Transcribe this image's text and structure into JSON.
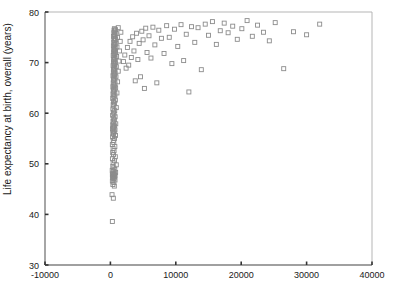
{
  "chart_data": {
    "type": "scatter",
    "title": "",
    "xlabel": "",
    "ylabel": "Life expectancy at birth, overall (years)",
    "xlim": [
      -10000,
      40000
    ],
    "ylim": [
      30,
      80
    ],
    "xticks": [
      -10000,
      0,
      10000,
      20000,
      30000,
      40000
    ],
    "xticklabels": [
      "-10000",
      "0",
      "10000",
      "20000",
      "30000",
      "40000"
    ],
    "yticks": [
      30,
      40,
      50,
      60,
      70,
      80
    ],
    "yticklabels": [
      "30",
      "40",
      "50",
      "60",
      "70",
      "80"
    ],
    "grid": false,
    "legend": null,
    "marker": "open-square",
    "marker_size_px": 4,
    "marker_color": "#8c8c8c",
    "axis_color": "#808080",
    "n_points": 198,
    "points": [
      [
        300,
        38.6
      ],
      [
        450,
        43.2
      ],
      [
        250,
        43.9
      ],
      [
        600,
        45.6
      ],
      [
        380,
        45.9
      ],
      [
        520,
        46.3
      ],
      [
        300,
        46.6
      ],
      [
        700,
        46.8
      ],
      [
        420,
        47.0
      ],
      [
        560,
        47.2
      ],
      [
        330,
        47.3
      ],
      [
        640,
        47.4
      ],
      [
        480,
        47.5
      ],
      [
        390,
        47.6
      ],
      [
        720,
        47.7
      ],
      [
        300,
        47.8
      ],
      [
        540,
        47.9
      ],
      [
        610,
        48.0
      ],
      [
        360,
        48.1
      ],
      [
        800,
        48.3
      ],
      [
        450,
        48.5
      ],
      [
        280,
        48.7
      ],
      [
        670,
        48.9
      ],
      [
        520,
        49.2
      ],
      [
        370,
        49.5
      ],
      [
        900,
        49.8
      ],
      [
        420,
        50.2
      ],
      [
        620,
        50.6
      ],
      [
        310,
        51.0
      ],
      [
        750,
        51.4
      ],
      [
        480,
        51.8
      ],
      [
        350,
        52.2
      ],
      [
        560,
        52.6
      ],
      [
        410,
        53.0
      ],
      [
        680,
        53.4
      ],
      [
        300,
        53.8
      ],
      [
        520,
        54.2
      ],
      [
        440,
        54.6
      ],
      [
        620,
        55.0
      ],
      [
        340,
        55.3
      ],
      [
        780,
        55.6
      ],
      [
        470,
        55.9
      ],
      [
        380,
        56.1
      ],
      [
        590,
        56.3
      ],
      [
        430,
        56.5
      ],
      [
        700,
        56.7
      ],
      [
        320,
        56.9
      ],
      [
        540,
        57.1
      ],
      [
        460,
        57.3
      ],
      [
        640,
        57.5
      ],
      [
        360,
        57.7
      ],
      [
        820,
        57.9
      ],
      [
        500,
        58.1
      ],
      [
        400,
        58.4
      ],
      [
        610,
        58.7
      ],
      [
        450,
        59.0
      ],
      [
        720,
        59.3
      ],
      [
        340,
        59.6
      ],
      [
        560,
        59.9
      ],
      [
        480,
        60.2
      ],
      [
        660,
        60.5
      ],
      [
        380,
        60.8
      ],
      [
        900,
        61.1
      ],
      [
        520,
        61.4
      ],
      [
        420,
        61.7
      ],
      [
        640,
        62.0
      ],
      [
        470,
        62.3
      ],
      [
        760,
        62.6
      ],
      [
        360,
        62.9
      ],
      [
        580,
        63.2
      ],
      [
        500,
        63.4
      ],
      [
        690,
        63.6
      ],
      [
        400,
        63.8
      ],
      [
        1000,
        64.0
      ],
      [
        540,
        64.2
      ],
      [
        440,
        64.4
      ],
      [
        660,
        64.6
      ],
      [
        490,
        64.8
      ],
      [
        800,
        65.0
      ],
      [
        380,
        65.2
      ],
      [
        600,
        65.4
      ],
      [
        520,
        65.6
      ],
      [
        710,
        65.8
      ],
      [
        430,
        66.0
      ],
      [
        1100,
        66.2
      ],
      [
        560,
        66.4
      ],
      [
        460,
        66.6
      ],
      [
        680,
        66.8
      ],
      [
        510,
        67.0
      ],
      [
        850,
        67.2
      ],
      [
        400,
        67.4
      ],
      [
        620,
        67.5
      ],
      [
        540,
        67.7
      ],
      [
        730,
        67.9
      ],
      [
        450,
        68.1
      ],
      [
        1200,
        68.3
      ],
      [
        580,
        68.5
      ],
      [
        480,
        68.6
      ],
      [
        700,
        68.8
      ],
      [
        530,
        69.0
      ],
      [
        900,
        69.2
      ],
      [
        420,
        69.4
      ],
      [
        640,
        69.5
      ],
      [
        560,
        69.7
      ],
      [
        760,
        69.9
      ],
      [
        470,
        70.1
      ],
      [
        1300,
        70.3
      ],
      [
        600,
        70.5
      ],
      [
        500,
        70.6
      ],
      [
        720,
        70.8
      ],
      [
        550,
        71.0
      ],
      [
        950,
        71.2
      ],
      [
        440,
        71.4
      ],
      [
        660,
        71.5
      ],
      [
        580,
        71.7
      ],
      [
        790,
        71.9
      ],
      [
        490,
        72.1
      ],
      [
        1400,
        72.3
      ],
      [
        620,
        72.4
      ],
      [
        520,
        72.6
      ],
      [
        740,
        72.8
      ],
      [
        570,
        73.0
      ],
      [
        1000,
        73.1
      ],
      [
        460,
        73.3
      ],
      [
        680,
        73.5
      ],
      [
        600,
        73.6
      ],
      [
        820,
        73.8
      ],
      [
        510,
        74.0
      ],
      [
        1500,
        74.2
      ],
      [
        650,
        74.3
      ],
      [
        540,
        74.5
      ],
      [
        770,
        74.7
      ],
      [
        590,
        74.8
      ],
      [
        1100,
        75.0
      ],
      [
        480,
        75.2
      ],
      [
        700,
        75.3
      ],
      [
        620,
        75.5
      ],
      [
        850,
        75.7
      ],
      [
        530,
        75.9
      ],
      [
        1600,
        76.0
      ],
      [
        670,
        76.2
      ],
      [
        560,
        76.4
      ],
      [
        790,
        76.5
      ],
      [
        610,
        76.7
      ],
      [
        1200,
        76.9
      ],
      [
        2000,
        70.2
      ],
      [
        2200,
        71.5
      ],
      [
        2400,
        68.9
      ],
      [
        2600,
        73.0
      ],
      [
        2800,
        69.5
      ],
      [
        3000,
        74.2
      ],
      [
        3200,
        71.0
      ],
      [
        3400,
        75.1
      ],
      [
        3600,
        72.3
      ],
      [
        3800,
        66.4
      ],
      [
        4000,
        75.8
      ],
      [
        4200,
        70.6
      ],
      [
        4400,
        73.8
      ],
      [
        4600,
        67.2
      ],
      [
        4800,
        76.2
      ],
      [
        5000,
        74.5
      ],
      [
        5200,
        64.9
      ],
      [
        5400,
        76.8
      ],
      [
        5600,
        72.0
      ],
      [
        5900,
        75.3
      ],
      [
        6200,
        70.9
      ],
      [
        6500,
        77.0
      ],
      [
        6800,
        73.5
      ],
      [
        7100,
        66.0
      ],
      [
        7400,
        76.4
      ],
      [
        7800,
        74.8
      ],
      [
        8200,
        71.8
      ],
      [
        8600,
        77.3
      ],
      [
        9000,
        75.0
      ],
      [
        9400,
        69.8
      ],
      [
        9800,
        76.6
      ],
      [
        10300,
        73.2
      ],
      [
        10800,
        77.5
      ],
      [
        11200,
        70.4
      ],
      [
        11600,
        75.6
      ],
      [
        12000,
        64.2
      ],
      [
        12400,
        77.1
      ],
      [
        12900,
        74.0
      ],
      [
        13400,
        76.9
      ],
      [
        13900,
        68.6
      ],
      [
        14500,
        77.6
      ],
      [
        15000,
        75.4
      ],
      [
        15600,
        78.1
      ],
      [
        16200,
        73.6
      ],
      [
        16800,
        76.3
      ],
      [
        17400,
        77.8
      ],
      [
        18000,
        75.9
      ],
      [
        18700,
        77.2
      ],
      [
        19400,
        74.6
      ],
      [
        20100,
        76.7
      ],
      [
        20900,
        78.3
      ],
      [
        21700,
        75.2
      ],
      [
        22500,
        77.4
      ],
      [
        23400,
        76.0
      ],
      [
        24300,
        74.3
      ],
      [
        25200,
        77.9
      ],
      [
        26500,
        68.8
      ],
      [
        28000,
        76.1
      ],
      [
        30000,
        75.5
      ],
      [
        32000,
        77.6
      ]
    ]
  }
}
